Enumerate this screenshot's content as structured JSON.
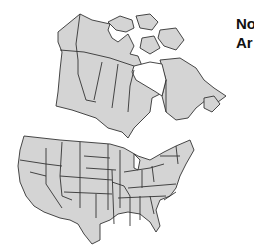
{
  "title": {
    "line1": "No",
    "line2": "Ar"
  },
  "map": {
    "regions": [
      "Canada",
      "United States"
    ],
    "fill_color": "#d4d4d4",
    "border_color": "#333333",
    "water_color": "#ffffff"
  }
}
